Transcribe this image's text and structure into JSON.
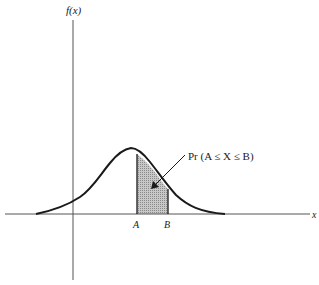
{
  "diagram": {
    "type": "probability-density-curve",
    "y_axis_label": "f(x)",
    "x_axis_label": "x",
    "lower_bound_label": "A",
    "upper_bound_label": "B",
    "annotation": "Pr (A ≤ X ≤ B)",
    "shaded_region": "area under f(x) between A and B",
    "colors": {
      "line": "#1a1a1a",
      "axis": "#555555",
      "shade": "#b8b8b8",
      "background": "#ffffff"
    }
  }
}
